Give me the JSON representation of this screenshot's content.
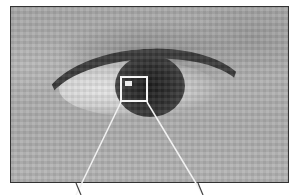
{
  "image": {
    "subject": "close-up grayscale photo of an eye",
    "style": "pixelated / noisy grayscale",
    "frame_color": "#333333",
    "highlight_color": "#f4f4f4"
  },
  "highlight_box": {
    "x": 120,
    "y": 76,
    "width": 28,
    "height": 26
  },
  "callout_lines": [
    {
      "x1": 121,
      "y1": 102,
      "x2": 76,
      "y2": 195
    },
    {
      "x1": 147,
      "y1": 102,
      "x2": 203,
      "y2": 195
    }
  ]
}
